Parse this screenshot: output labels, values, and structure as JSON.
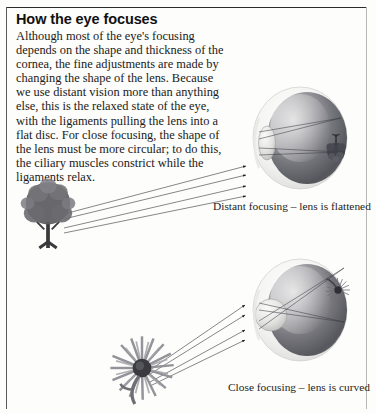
{
  "page": {
    "heading": "How the eye focuses",
    "body": "Although most of the eye's focusing depends on the shape and thickness of the cornea, the fine adjustments are made by changing the shape of the lens. Because we use distant vision more than anything else, this is the relaxed state of the eye, with the ligaments pulling the lens into a flat disc. For close focusing, the shape of the lens must be more circular; to do this, the ciliary muscles constrict while the ligaments relax."
  },
  "figures": {
    "distant": {
      "caption": "Distant focusing – lens is flattened",
      "object": "tree",
      "lens_shape": "flattened",
      "retinal_image": "inverted-tree"
    },
    "close": {
      "caption": "Close focusing – lens is curved",
      "object": "flower",
      "lens_shape": "curved",
      "retinal_image": "inverted-flower"
    }
  },
  "colors": {
    "paper": "#fdfdfb",
    "ink": "#1a1a1a",
    "rule": "#2b2b2b",
    "ray": "#3a3a46",
    "eye_dark": "#4c4c52",
    "eye_light": "#f2f2f0"
  }
}
